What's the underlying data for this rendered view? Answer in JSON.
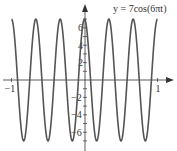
{
  "chart_data": {
    "type": "line",
    "title": "y = 7cos(6πt)",
    "function": "7*cos(6*pi*x)",
    "amplitude": 7,
    "angular_frequency": "6π",
    "period": 0.3333,
    "xlabel": "",
    "ylabel": "",
    "xlim": [
      -1,
      1
    ],
    "ylim": [
      -7,
      7
    ],
    "x_ticks": [
      -1,
      1
    ],
    "x_tick_labels": [
      "−1",
      "1"
    ],
    "y_ticks": [
      -6,
      -4,
      -2,
      2,
      4,
      6
    ],
    "y_tick_labels": [
      "−6",
      "−4",
      "−2",
      "2",
      "4",
      "6"
    ],
    "grid": false,
    "legend": null,
    "series": [
      {
        "name": "y = 7cos(6πt)",
        "x": [
          -1,
          -0.8333,
          -0.6667,
          -0.5,
          -0.3333,
          -0.1667,
          0,
          0.1667,
          0.3333,
          0.5,
          0.6667,
          0.8333,
          1
        ],
        "values": [
          7,
          -7,
          7,
          -7,
          7,
          -7,
          7,
          -7,
          7,
          -7,
          7,
          -7,
          7
        ]
      }
    ],
    "line_color": "#555555",
    "axis_color": "#333333"
  }
}
